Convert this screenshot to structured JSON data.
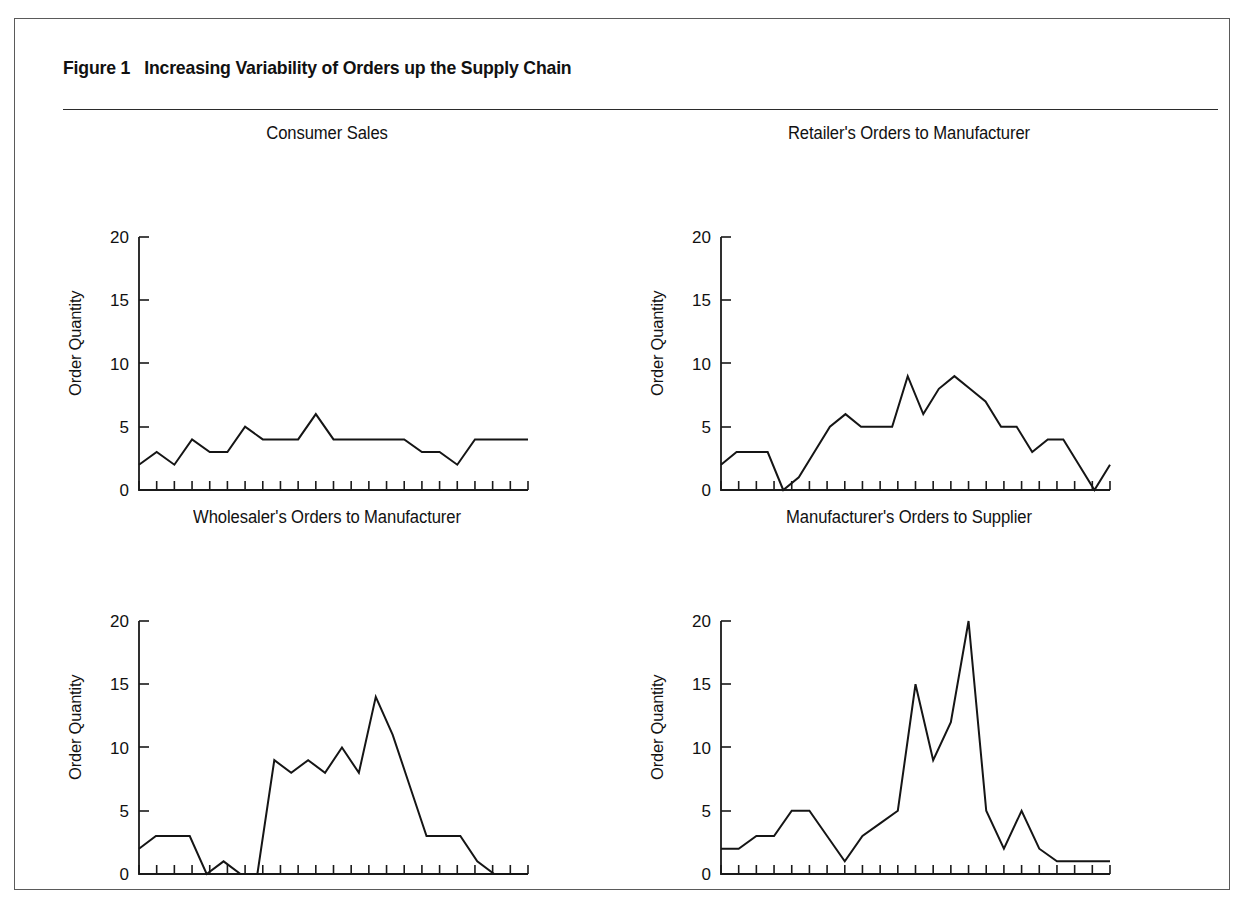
{
  "figure": {
    "number_label": "Figure 1",
    "title": "Increasing Variability of Orders up the Supply Chain"
  },
  "axis": {
    "y_label": "Order Quantity",
    "x_label": "Time",
    "y_ticks": [
      "0",
      "5",
      "10",
      "15",
      "20"
    ]
  },
  "panels": [
    {
      "id": "consumer-sales",
      "title": "Consumer Sales"
    },
    {
      "id": "retailer-orders",
      "title": "Retailer's Orders to Manufacturer"
    },
    {
      "id": "wholesaler-orders",
      "title": "Wholesaler's Orders to Manufacturer"
    },
    {
      "id": "manufacturer-orders",
      "title": "Manufacturer's Orders to Supplier"
    }
  ],
  "chart_data": [
    {
      "type": "line",
      "title": "Consumer Sales",
      "xlabel": "Time",
      "ylabel": "Order Quantity",
      "ylim": [
        0,
        20
      ],
      "yticks": [
        0,
        5,
        10,
        15,
        20
      ],
      "grid": false,
      "legend": "none",
      "x": [
        1,
        2,
        3,
        4,
        5,
        6,
        7,
        8,
        9,
        10,
        11,
        12,
        13,
        14,
        15,
        16,
        17,
        18,
        19,
        20,
        21,
        22,
        23
      ],
      "values": [
        2,
        3,
        2,
        4,
        3,
        3,
        5,
        4,
        4,
        4,
        6,
        4,
        4,
        4,
        4,
        4,
        3,
        3,
        2,
        4,
        4,
        4,
        4
      ]
    },
    {
      "type": "line",
      "title": "Retailer's Orders to Manufacturer",
      "xlabel": "Time",
      "ylabel": "Order Quantity",
      "ylim": [
        0,
        20
      ],
      "yticks": [
        0,
        5,
        10,
        15,
        20
      ],
      "grid": false,
      "legend": "none",
      "x": [
        1,
        2,
        3,
        4,
        5,
        6,
        7,
        8,
        9,
        10,
        11,
        12,
        13,
        14,
        15,
        16,
        17,
        18,
        19,
        20,
        21,
        22,
        23
      ],
      "values": [
        2,
        3,
        3,
        3,
        0,
        1,
        3,
        5,
        6,
        5,
        5,
        5,
        9,
        6,
        8,
        9,
        8,
        7,
        5,
        5,
        3,
        4,
        4,
        2,
        0,
        2
      ]
    },
    {
      "type": "line",
      "title": "Wholesaler's Orders to Manufacturer",
      "xlabel": "Time",
      "ylabel": "Order Quantity",
      "ylim": [
        0,
        20
      ],
      "yticks": [
        0,
        5,
        10,
        15,
        20
      ],
      "grid": false,
      "legend": "none",
      "x": [
        1,
        2,
        3,
        4,
        5,
        6,
        7,
        8,
        9,
        10,
        11,
        12,
        13,
        14,
        15,
        16,
        17,
        18,
        19,
        20,
        21,
        22,
        23
      ],
      "values": [
        2,
        3,
        3,
        3,
        0,
        1,
        0,
        0,
        9,
        8,
        9,
        8,
        10,
        8,
        14,
        11,
        7,
        3,
        3,
        3,
        1,
        0,
        0,
        0
      ]
    },
    {
      "type": "line",
      "title": "Manufacturer's Orders to Supplier",
      "xlabel": "Time",
      "ylabel": "Order Quantity",
      "ylim": [
        0,
        20
      ],
      "yticks": [
        0,
        5,
        10,
        15,
        20
      ],
      "grid": false,
      "legend": "none",
      "x": [
        1,
        2,
        3,
        4,
        5,
        6,
        7,
        8,
        9,
        10,
        11,
        12,
        13,
        14,
        15,
        16,
        17,
        18,
        19,
        20,
        21,
        22,
        23
      ],
      "values": [
        2,
        2,
        3,
        3,
        5,
        5,
        3,
        1,
        3,
        4,
        5,
        15,
        9,
        12,
        20,
        5,
        2,
        5,
        2,
        1,
        1,
        1,
        1
      ]
    }
  ]
}
